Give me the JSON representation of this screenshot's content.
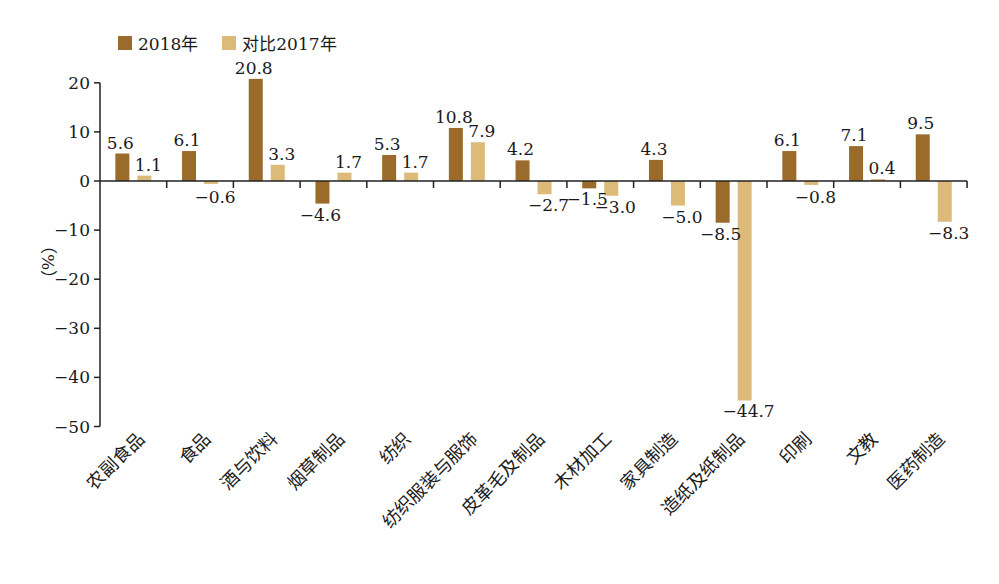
{
  "chart_data": {
    "type": "bar",
    "title": "",
    "xlabel": "",
    "ylabel": "（%）",
    "ylim": [
      -50,
      20
    ],
    "yticks": [
      20,
      10,
      0,
      -10,
      -20,
      -30,
      -40,
      -50
    ],
    "grid": false,
    "legend_position": "top-left",
    "categories": [
      "农副食品",
      "食品",
      "酒与饮料",
      "烟草制品",
      "纺织",
      "纺织服装与服饰",
      "皮革毛及制品",
      "木材加工",
      "家具制造",
      "造纸及纸制品",
      "印刷",
      "文教",
      "医药制造"
    ],
    "series": [
      {
        "name": "2018年",
        "color": "#9a6b2a",
        "values": [
          5.6,
          6.1,
          20.8,
          -4.6,
          5.3,
          10.8,
          4.2,
          -1.5,
          4.3,
          -8.5,
          6.1,
          7.1,
          9.5
        ]
      },
      {
        "name": "对比2017年",
        "color": "#dcbb7a",
        "values": [
          1.1,
          -0.6,
          3.3,
          1.7,
          1.7,
          7.9,
          -2.7,
          -3.0,
          -5.0,
          -44.7,
          -0.8,
          0.4,
          -8.3
        ]
      }
    ],
    "data_labels": {
      "2018年": [
        "5.6",
        "6.1",
        "20.8",
        "-4.6",
        "5.3",
        "10.8",
        "4.2",
        "-1.5",
        "4.3",
        "-8.5",
        "6.1",
        "7.1",
        "9.5"
      ],
      "对比2017年": [
        "1.1",
        "-0.6",
        "3.3",
        "1.7",
        "1.7",
        "7.9",
        "-2.7",
        "-3.0",
        "-5.0",
        "-44.7",
        "-0.8",
        "0.4",
        "-8.3"
      ]
    }
  },
  "legend": {
    "items": [
      {
        "label": "2018年",
        "color": "#9a6b2a"
      },
      {
        "label": "对比2017年",
        "color": "#dcbb7a"
      }
    ]
  }
}
